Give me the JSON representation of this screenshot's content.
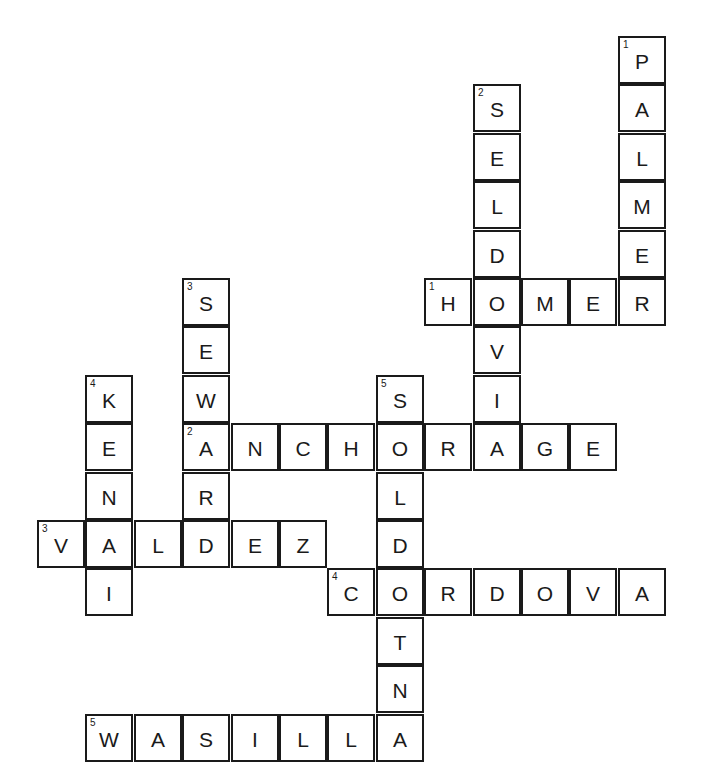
{
  "puzzle": {
    "type": "crossword",
    "theme": "Alaska towns",
    "across": [
      {
        "number": "1",
        "answer": "HOMER",
        "row": 5,
        "col": 8
      },
      {
        "number": "2",
        "answer": "ANCHORAGE",
        "row": 8,
        "col": 3
      },
      {
        "number": "3",
        "answer": "VALDEZ",
        "row": 10,
        "col": 0
      },
      {
        "number": "4",
        "answer": "CORDOVA",
        "row": 11,
        "col": 6
      },
      {
        "number": "5",
        "answer": "WASILLA",
        "row": 14,
        "col": 1
      }
    ],
    "down": [
      {
        "number": "1",
        "answer": "PALMER",
        "row": 0,
        "col": 12
      },
      {
        "number": "2",
        "answer": "SELDOVI",
        "row": 1,
        "col": 9
      },
      {
        "number": "3",
        "answer": "SEWARD",
        "row": 5,
        "col": 3
      },
      {
        "number": "4",
        "answer": "KENAI",
        "row": 7,
        "col": 1
      },
      {
        "number": "5",
        "answer": "SOLDOTNA",
        "row": 7,
        "col": 7
      }
    ]
  }
}
